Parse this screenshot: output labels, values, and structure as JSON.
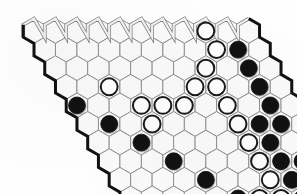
{
  "figure": {
    "board_game": "Hex",
    "board_shape": "rhombus",
    "size": 11,
    "background_color": "#ffffff",
    "cell_empty_color": "#fbfbfb",
    "grid_line_color": "#8a8a8a",
    "black_stone_color": "#111111",
    "white_stone_color": "#ffffff",
    "white_stone_outline_color": "#1a1a1a",
    "edge_black_color": "#111111",
    "edge_white_color": "#f2f2f2",
    "edge_white_outline_color": "#7a7a7a"
  },
  "geometry": {
    "hex_radius": 12.4,
    "origin_x": 34.0,
    "origin_y": 31.0,
    "col_step_x": 21.48,
    "col_step_y": 0,
    "row_step_x": 10.74,
    "row_step_y": 18.6
  },
  "chart_data": {
    "type": "table",
    "xlabel": "column (a-k)",
    "ylabel": "row (1-11)",
    "columns": [
      "a",
      "b",
      "c",
      "d",
      "e",
      "f",
      "g",
      "h",
      "i",
      "j",
      "k"
    ],
    "rows": [
      "1",
      "2",
      "3",
      "4",
      "5",
      "6",
      "7",
      "8",
      "9",
      "10",
      "11"
    ],
    "legend": [
      "black stone",
      "white stone",
      "empty cell"
    ],
    "values": [
      [
        0,
        0,
        0,
        0,
        0,
        0,
        0,
        0,
        2,
        0,
        0
      ],
      [
        0,
        0,
        0,
        0,
        0,
        0,
        0,
        0,
        2,
        1,
        0
      ],
      [
        0,
        0,
        0,
        0,
        0,
        0,
        0,
        2,
        0,
        1,
        0
      ],
      [
        0,
        0,
        2,
        0,
        0,
        0,
        2,
        2,
        0,
        1,
        0
      ],
      [
        1,
        0,
        0,
        2,
        2,
        2,
        0,
        2,
        0,
        1,
        0
      ],
      [
        0,
        1,
        0,
        2,
        0,
        0,
        0,
        2,
        1,
        1,
        0
      ],
      [
        0,
        0,
        1,
        0,
        0,
        0,
        0,
        2,
        1,
        0,
        1
      ],
      [
        0,
        0,
        0,
        1,
        0,
        0,
        0,
        2,
        1,
        1,
        0
      ],
      [
        0,
        0,
        0,
        0,
        1,
        0,
        0,
        2,
        1,
        0,
        0
      ],
      [
        0,
        0,
        0,
        0,
        0,
        1,
        2,
        2,
        1,
        0,
        0
      ],
      [
        0,
        0,
        0,
        0,
        0,
        0,
        2,
        0,
        1,
        0,
        0
      ]
    ],
    "black_stones": [
      "j2",
      "j3",
      "j4",
      "a5",
      "j5",
      "b6",
      "i6",
      "j6",
      "c7",
      "i7",
      "k7",
      "d8",
      "i8",
      "j8",
      "e9",
      "i9",
      "f10",
      "i10",
      "i11"
    ],
    "white_stones": [
      "i1",
      "i2",
      "h3",
      "c4",
      "g4",
      "h4",
      "d5",
      "e5",
      "f5",
      "h5",
      "d6",
      "h6",
      "h7",
      "h8",
      "h9",
      "g10",
      "h10",
      "g11"
    ],
    "counts": {
      "black": 19,
      "white": 18,
      "empty": 84
    }
  }
}
